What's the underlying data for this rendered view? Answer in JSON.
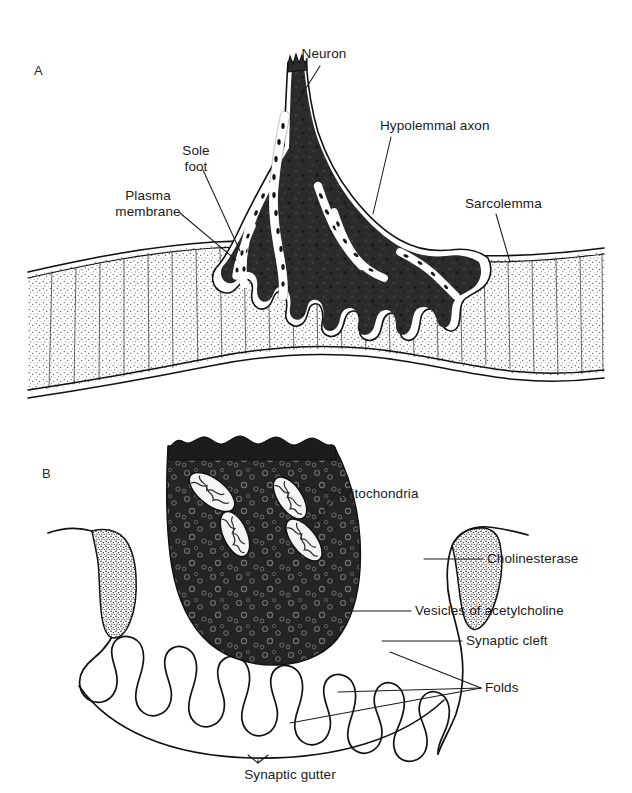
{
  "figure": {
    "background_color": "#ffffff",
    "ink_color": "#111111",
    "width": 632,
    "height": 793
  },
  "panels": [
    {
      "id": "A",
      "letter": "A",
      "caption": "",
      "description": "Motor end plate on a skeletal muscle fibre, showing the neuron terminating in sole feet over the sarcolemma",
      "labels": [
        {
          "name": "neuron",
          "text": "Neuron",
          "lines": [
            "Neuron"
          ],
          "x": 324,
          "y": 58,
          "anchor": "middle"
        },
        {
          "name": "hypolemmal-axon",
          "text": "Hypolemmal axon",
          "lines": [
            "Hypolemmal axon"
          ],
          "x": 380,
          "y": 130,
          "anchor": "start"
        },
        {
          "name": "sole-foot",
          "text": "Sole foot",
          "lines": [
            "Sole",
            "foot"
          ],
          "x": 196,
          "y": 155,
          "anchor": "middle"
        },
        {
          "name": "plasma-membrane",
          "text": "Plasma membrane",
          "lines": [
            "Plasma",
            "membrane"
          ],
          "x": 148,
          "y": 200,
          "anchor": "middle"
        },
        {
          "name": "sarcolemma",
          "text": "Sarcolemma",
          "lines": [
            "Sarcolemma"
          ],
          "x": 465,
          "y": 208,
          "anchor": "start"
        }
      ]
    },
    {
      "id": "B",
      "letter": "B",
      "caption": "",
      "description": "Enlarged synaptic region of the motor end plate showing mitochondria, acetylcholine vesicles, cholinesterase, synaptic cleft, junctional folds and synaptic gutter",
      "labels": [
        {
          "name": "mitochondria",
          "text": "Mitochondria",
          "lines": [
            "Mitochondria"
          ],
          "x": 340,
          "y": 498,
          "anchor": "start"
        },
        {
          "name": "cholinesterase",
          "text": "Cholinesterase",
          "lines": [
            "Cholinesterase"
          ],
          "x": 487,
          "y": 563,
          "anchor": "start"
        },
        {
          "name": "vesicles-of-acetylcholine",
          "text": "Vesicles of acetylcholine",
          "lines": [
            "Vesicles of acetylcholine"
          ],
          "x": 415,
          "y": 615,
          "anchor": "start"
        },
        {
          "name": "synaptic-cleft",
          "text": "Synaptic cleft",
          "lines": [
            "Synaptic cleft"
          ],
          "x": 466,
          "y": 645,
          "anchor": "start"
        },
        {
          "name": "folds",
          "text": "Folds",
          "lines": [
            "Folds"
          ],
          "x": 485,
          "y": 692,
          "anchor": "start"
        },
        {
          "name": "synaptic-gutter",
          "text": "Synaptic gutter",
          "lines": [
            "Synaptic gutter"
          ],
          "x": 290,
          "y": 775,
          "anchor": "middle"
        }
      ],
      "counts": {
        "mitochondria": 4,
        "folds": 10,
        "cholinesterase_caps": 2
      }
    }
  ]
}
